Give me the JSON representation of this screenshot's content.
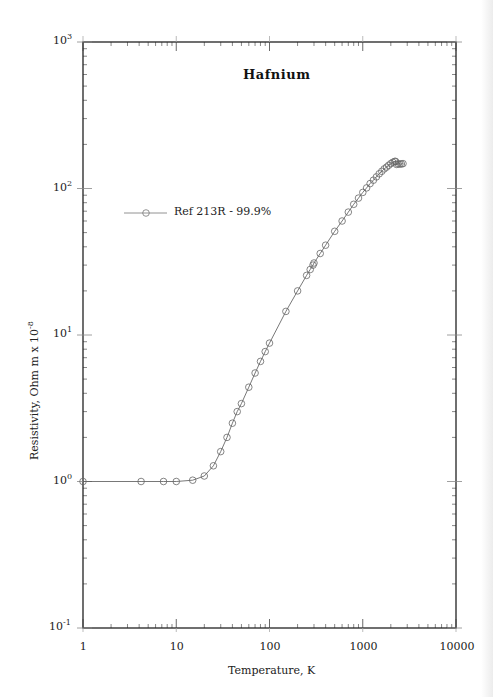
{
  "chart_data": {
    "type": "scatter",
    "title": "Hafnium",
    "xlabel": "Temperature,  K",
    "ylabel": "Resistivity, Ohm m x 10",
    "ylabel_exponent": "-8",
    "xscale": "log",
    "yscale": "log",
    "xlim": [
      1,
      10000
    ],
    "ylim": [
      0.1,
      1000
    ],
    "x_ticks": [
      "1",
      "10",
      "100",
      "1000",
      "10000"
    ],
    "y_ticks": [
      {
        "base": "10",
        "exp": "-1"
      },
      {
        "base": "10",
        "exp": "0"
      },
      {
        "base": "10",
        "exp": "1"
      },
      {
        "base": "10",
        "exp": "2"
      },
      {
        "base": "10",
        "exp": "3"
      }
    ],
    "grid": false,
    "legend_position": "upper-left",
    "series": [
      {
        "name": "Ref 213R - 99.9%",
        "marker": "open-circle",
        "line": "solid",
        "color": "#555555",
        "x": [
          1,
          4.2,
          7.3,
          10,
          15,
          20,
          25,
          30,
          35,
          40,
          45,
          50,
          60,
          70,
          80,
          90,
          100,
          150,
          200,
          250,
          273,
          293,
          300,
          350,
          400,
          500,
          600,
          700,
          800,
          900,
          1000,
          1100,
          1200,
          1300,
          1400,
          1500,
          1600,
          1700,
          1800,
          1900,
          2000,
          2100,
          2200,
          2250,
          2300,
          2400,
          2500,
          2600,
          2700
        ],
        "y": [
          1.0,
          1.0,
          1.0,
          1.0,
          1.02,
          1.09,
          1.28,
          1.6,
          2.0,
          2.5,
          3.0,
          3.4,
          4.4,
          5.5,
          6.6,
          7.7,
          8.8,
          14.5,
          20,
          25.5,
          28,
          30,
          31,
          36,
          41,
          51,
          60,
          69,
          78,
          86,
          94,
          101,
          108,
          114,
          120,
          126,
          131,
          136,
          140,
          144,
          148,
          151,
          153,
          153,
          146,
          147,
          147,
          147,
          148
        ]
      }
    ]
  },
  "layout": {
    "plot_left": 83,
    "plot_right": 456,
    "plot_top": 42,
    "plot_bottom": 628
  }
}
